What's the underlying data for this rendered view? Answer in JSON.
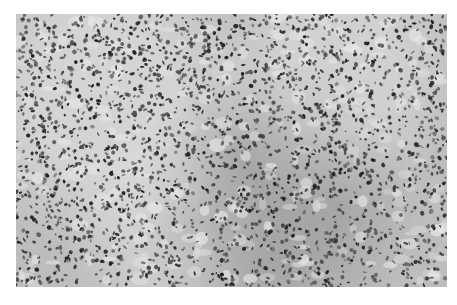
{
  "figure": {
    "kind": "grayscale histology micrograph",
    "colors": {
      "background": "#bdbdbd",
      "nucleus_dark": "#222222",
      "nucleus_mid": "#555555",
      "stroma_light": "#e6e6e6"
    }
  },
  "caption": {
    "text": "",
    "note": "caption cropped at bottom edge; illegible"
  }
}
